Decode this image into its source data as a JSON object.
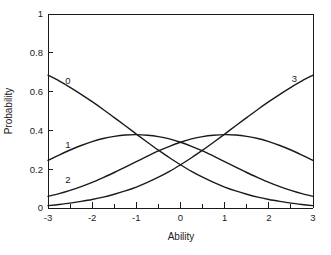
{
  "chart_data": {
    "type": "line",
    "title": "",
    "xlabel": "Ability",
    "ylabel": "Probability",
    "xlim": [
      -3,
      3
    ],
    "ylim": [
      0,
      1
    ],
    "grid": false,
    "legend_position": "inline-curve-labels",
    "x_ticks_major": [
      "-3",
      "-2",
      "-1",
      "0",
      "1",
      "2",
      "3"
    ],
    "x_tick_major_values": [
      -3,
      -2,
      -1,
      0,
      1,
      2,
      3
    ],
    "x_tick_minor_values": [
      -2.5,
      -1.5,
      -0.5,
      0.5,
      1.5,
      2.5
    ],
    "y_ticks_major": [
      "0",
      "0.2",
      "0.4",
      "0.6",
      "0.8",
      "1"
    ],
    "y_tick_major_values": [
      0,
      0.2,
      0.4,
      0.6,
      0.8,
      1
    ],
    "x": [
      -3,
      -2.75,
      -2.5,
      -2.25,
      -2,
      -1.75,
      -1.5,
      -1.25,
      -1,
      -0.75,
      -0.5,
      -0.25,
      0,
      0.25,
      0.5,
      0.75,
      1,
      1.25,
      1.5,
      1.75,
      2,
      2.25,
      2.5,
      2.75,
      3
    ],
    "series": [
      {
        "name": "0",
        "label": "0",
        "label_x": -2.55,
        "label_y": 0.655,
        "values": [
          0.685,
          0.655,
          0.622,
          0.586,
          0.548,
          0.508,
          0.466,
          0.424,
          0.381,
          0.339,
          0.298,
          0.259,
          0.223,
          0.189,
          0.159,
          0.132,
          0.108,
          0.088,
          0.071,
          0.056,
          0.044,
          0.034,
          0.025,
          0.018,
          0.012
        ]
      },
      {
        "name": "1",
        "label": "1",
        "label_x": -2.55,
        "label_y": 0.325,
        "values": [
          0.245,
          0.273,
          0.299,
          0.322,
          0.342,
          0.358,
          0.369,
          0.376,
          0.378,
          0.375,
          0.368,
          0.356,
          0.339,
          0.318,
          0.294,
          0.267,
          0.239,
          0.211,
          0.183,
          0.157,
          0.132,
          0.11,
          0.091,
          0.074,
          0.06
        ]
      },
      {
        "name": "2",
        "label": "2",
        "label_x": -2.55,
        "label_y": 0.145,
        "values": [
          0.06,
          0.074,
          0.091,
          0.11,
          0.132,
          0.157,
          0.183,
          0.211,
          0.239,
          0.267,
          0.294,
          0.318,
          0.339,
          0.356,
          0.368,
          0.375,
          0.378,
          0.376,
          0.369,
          0.358,
          0.342,
          0.322,
          0.299,
          0.273,
          0.245
        ]
      },
      {
        "name": "3",
        "label": "3",
        "label_x": 2.58,
        "label_y": 0.665,
        "values": [
          0.012,
          0.018,
          0.025,
          0.034,
          0.044,
          0.056,
          0.071,
          0.088,
          0.108,
          0.132,
          0.159,
          0.189,
          0.223,
          0.259,
          0.298,
          0.339,
          0.381,
          0.424,
          0.466,
          0.508,
          0.548,
          0.586,
          0.622,
          0.655,
          0.685
        ]
      }
    ]
  },
  "colors": {
    "curve": "#1a1a1a",
    "axis": "#1a1a1a",
    "background": "#ffffff"
  }
}
